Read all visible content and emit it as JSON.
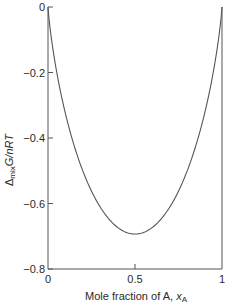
{
  "chart_data": {
    "type": "line",
    "title": "",
    "xlabel": "Mole fraction of A, x_A",
    "xlabel_parts": {
      "main": "Mole fraction of A, ",
      "var": "x",
      "sub": "A"
    },
    "ylabel": "Δ_mix G/nRT",
    "ylabel_parts": {
      "delta": "Δ",
      "sub": "mix",
      "main": "G/nRT"
    },
    "xlim": [
      0,
      1
    ],
    "ylim": [
      -0.8,
      0
    ],
    "x_ticks": [
      {
        "value": 0,
        "label": "0"
      },
      {
        "value": 0.5,
        "label": "0.5"
      },
      {
        "value": 1,
        "label": "1"
      }
    ],
    "y_ticks": [
      {
        "value": 0,
        "label": "0"
      },
      {
        "value": -0.2,
        "label": "−0.2"
      },
      {
        "value": -0.4,
        "label": "−0.4"
      },
      {
        "value": -0.6,
        "label": "−0.6"
      },
      {
        "value": -0.8,
        "label": "−0.8"
      }
    ],
    "grid": false,
    "legend": null,
    "series": [
      {
        "name": "Δmix G/nRT = xA ln xA + (1−xA) ln(1−xA)",
        "x": [
          0,
          0.05,
          0.1,
          0.15,
          0.2,
          0.25,
          0.3,
          0.35,
          0.4,
          0.45,
          0.5,
          0.55,
          0.6,
          0.65,
          0.7,
          0.75,
          0.8,
          0.85,
          0.9,
          0.95,
          1
        ],
        "values": [
          0,
          -0.199,
          -0.325,
          -0.423,
          -0.5,
          -0.562,
          -0.611,
          -0.647,
          -0.673,
          -0.688,
          -0.693,
          -0.688,
          -0.673,
          -0.647,
          -0.611,
          -0.562,
          -0.5,
          -0.423,
          -0.325,
          -0.199,
          0
        ]
      }
    ],
    "annotations": [
      {
        "text": "minimum at x_A = 0.5, value ≈ −0.69"
      }
    ],
    "colors": {
      "line": "#555555",
      "axis": "#555555",
      "text": "#2a2a2a"
    }
  }
}
